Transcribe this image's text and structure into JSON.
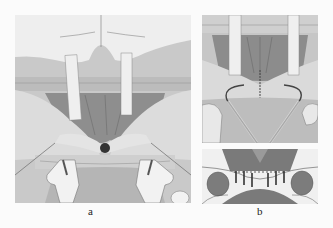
{
  "figure": {
    "panels": [
      {
        "id": "a",
        "label": "a",
        "description": "Surgical illustration: exposed tissue with two vertical retractor straps and two forked retractors at bottom"
      },
      {
        "id": "b",
        "label": "b",
        "description": "Upper: suture loop drawn across incision with retractor straps; Lower: cross-section showing placed sutures"
      }
    ]
  },
  "colors": {
    "background": "#fbfbfb",
    "tissue_light": "#e8e8e8",
    "tissue_mid": "#bdbdbd",
    "tissue_dark": "#8a8a8a",
    "section_dark": "#7a7a7a",
    "ink": "#222222"
  }
}
